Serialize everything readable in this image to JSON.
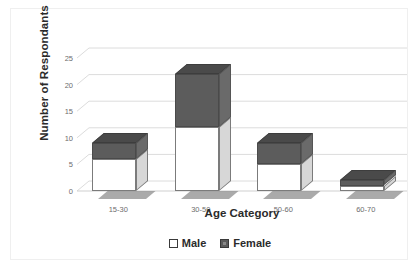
{
  "chart_data": {
    "type": "bar",
    "subtype": "stacked-column-3d",
    "title": "",
    "xlabel": "Age Category",
    "ylabel": "Number of Respondants",
    "categories": [
      "15-30",
      "30-50",
      "50-60",
      "60-70"
    ],
    "series": [
      {
        "name": "Male",
        "color": "#ffffff",
        "values": [
          6,
          12,
          5,
          1
        ]
      },
      {
        "name": "Female",
        "color": "#5c5c5c",
        "values": [
          3,
          10,
          4,
          1
        ]
      }
    ],
    "totals": [
      9,
      22,
      9,
      2
    ],
    "ylim": [
      0,
      25
    ],
    "ytick_labels": [
      "0",
      "5",
      "10",
      "15",
      "20",
      "25"
    ],
    "ytick_values": [
      0,
      5,
      10,
      15,
      20,
      25
    ],
    "grid": true,
    "legend_position": "bottom"
  },
  "axis": {
    "y_title": "Number of Respondants",
    "x_title": "Age Category"
  },
  "legend": {
    "items": [
      {
        "label": "Male",
        "swatch": "square-outline-icon"
      },
      {
        "label": "Female",
        "swatch": "square-filled-icon"
      }
    ]
  }
}
